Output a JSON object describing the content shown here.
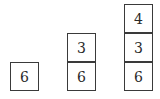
{
  "stacks": [
    {
      "name": "stack-1",
      "boxes": [
        "6"
      ]
    },
    {
      "name": "stack-2",
      "boxes": [
        "3",
        "6"
      ]
    },
    {
      "name": "stack-3",
      "boxes": [
        "4",
        "3",
        "6"
      ]
    }
  ]
}
